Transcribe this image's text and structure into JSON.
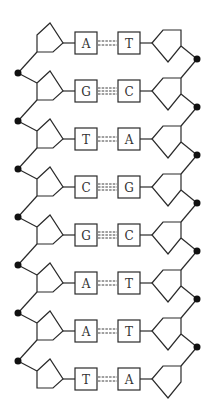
{
  "colors": {
    "stroke": "#2a2a2a",
    "fill": "#ffffff",
    "phosphate": "#111111"
  },
  "pairs": [
    {
      "left": "A",
      "right": "T",
      "bonds": 2
    },
    {
      "left": "G",
      "right": "C",
      "bonds": 3
    },
    {
      "left": "T",
      "right": "A",
      "bonds": 2
    },
    {
      "left": "C",
      "right": "G",
      "bonds": 3
    },
    {
      "left": "G",
      "right": "C",
      "bonds": 3
    },
    {
      "left": "A",
      "right": "T",
      "bonds": 2
    },
    {
      "left": "A",
      "right": "T",
      "bonds": 2
    },
    {
      "left": "T",
      "right": "A",
      "bonds": 2
    }
  ]
}
